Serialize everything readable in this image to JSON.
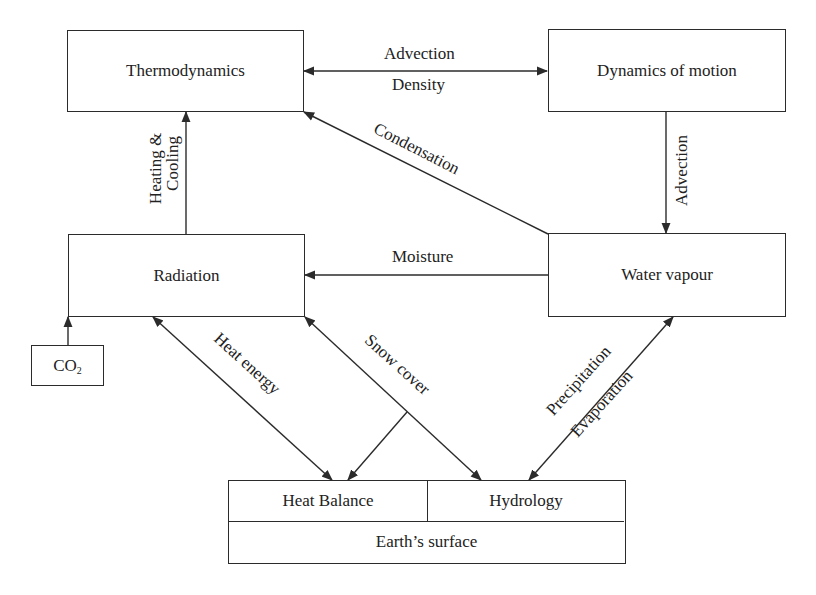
{
  "diagram": {
    "type": "flow",
    "nodes": {
      "thermodynamics": "Thermodynamics",
      "dynamics_of_motion": "Dynamics of motion",
      "radiation": "Radiation",
      "water_vapour": "Water vapour",
      "co2": "CO",
      "co2_sub": "2",
      "heat_balance": "Heat Balance",
      "hydrology": "Hydrology",
      "earths_surface": "Earth’s surface"
    },
    "edges": {
      "advection_top": "Advection",
      "density": "Density",
      "advection_right": "Advection",
      "condensation": "Condensation",
      "heating": "Heating &",
      "cooling": "Cooling",
      "moisture": "Moisture",
      "heat_energy": "Heat energy",
      "snow_cover": "Snow cover",
      "precipitation": "Precipitation",
      "evaporation": "Evaporation"
    },
    "connections": [
      {
        "from": "Thermodynamics",
        "to": "Dynamics of motion",
        "labels": [
          "Advection",
          "Density"
        ],
        "bidirectional": true
      },
      {
        "from": "Dynamics of motion",
        "to": "Water vapour",
        "labels": [
          "Advection"
        ]
      },
      {
        "from": "Water vapour",
        "to": "Thermodynamics",
        "labels": [
          "Condensation"
        ]
      },
      {
        "from": "Water vapour",
        "to": "Radiation",
        "labels": [
          "Moisture"
        ]
      },
      {
        "from": "Radiation",
        "to": "Thermodynamics",
        "labels": [
          "Heating &",
          "Cooling"
        ]
      },
      {
        "from": "CO2",
        "to": "Radiation",
        "labels": []
      },
      {
        "from": "Radiation",
        "to": "Heat Balance",
        "labels": [
          "Heat energy"
        ],
        "bidirectional": true
      },
      {
        "from": "Hydrology",
        "to": "Radiation",
        "labels": [
          "Snow cover"
        ],
        "bidirectional": true
      },
      {
        "from": "Snow cover",
        "to": "Heat Balance",
        "labels": []
      },
      {
        "from": "Water vapour",
        "to": "Hydrology",
        "labels": [
          "Precipitation",
          "Evaporation"
        ],
        "bidirectional": true
      }
    ]
  }
}
